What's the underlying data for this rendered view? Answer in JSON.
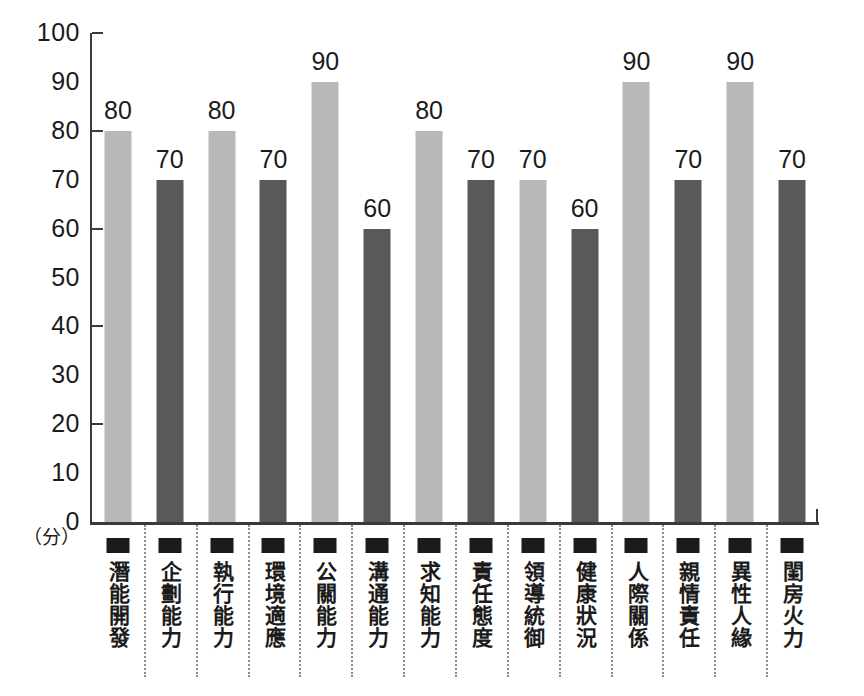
{
  "chart_data": {
    "type": "bar",
    "title": "",
    "subtitle": "",
    "xlabel": "",
    "ylabel": "",
    "yunit": "（分）",
    "ylim": [
      0,
      100
    ],
    "grid": false,
    "legend": "none",
    "y_tick_labels": [
      "100",
      "90",
      "80",
      "70",
      "60",
      "50",
      "40",
      "30",
      "20",
      "10",
      "0"
    ],
    "y_tick_values": [
      100,
      90,
      80,
      70,
      60,
      50,
      40,
      30,
      20,
      10,
      0
    ],
    "y_major_ticks": [
      100,
      80,
      60,
      40,
      20,
      0
    ],
    "categories": [
      "潛能開發",
      "企劃能力",
      "執行能力",
      "環境適應",
      "公關能力",
      "溝通能力",
      "求知能力",
      "責任態度",
      "領導統御",
      "健康狀況",
      "人際關係",
      "親情責任",
      "異性人緣",
      "閨房火力"
    ],
    "values": [
      80,
      70,
      80,
      70,
      90,
      60,
      80,
      70,
      70,
      60,
      90,
      70,
      90,
      70
    ],
    "bar_colors": [
      "#b8b8b8",
      "#595959",
      "#b8b8b8",
      "#595959",
      "#b8b8b8",
      "#595959",
      "#b8b8b8",
      "#595959",
      "#b8b8b8",
      "#595959",
      "#b8b8b8",
      "#595959",
      "#b8b8b8",
      "#595959"
    ]
  },
  "colors": {
    "light_bar": "#b8b8b8",
    "dark_bar": "#595959",
    "axis": "#3a3a3a",
    "text": "#1b1b1b",
    "separator": "#8d8d8d",
    "background": "#ffffff"
  }
}
